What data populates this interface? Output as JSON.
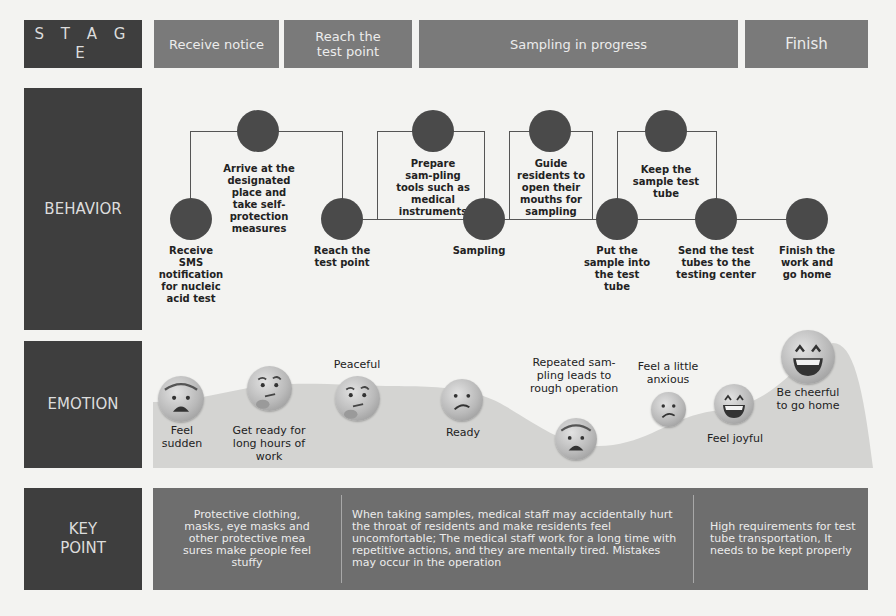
{
  "rows": {
    "stage": "S T A G E",
    "behavior": "BEHAVIOR",
    "emotion": "EMOTION",
    "key_point_line1": "KEY",
    "key_point_line2": "POINT"
  },
  "stages": [
    {
      "label": "Receive notice"
    },
    {
      "label": "Reach the test point"
    },
    {
      "label": "Sampling in progress"
    },
    {
      "label": "Finish"
    }
  ],
  "behaviors": {
    "bottom": [
      {
        "label": "Receive SMS notification for nucleic acid test"
      },
      {
        "label": "Reach the test point"
      },
      {
        "label": "Sampling"
      },
      {
        "label": "Put the sample into the test tube"
      },
      {
        "label": "Send the test tubes to the testing center"
      },
      {
        "label": "Finish the work and go home"
      }
    ],
    "top": [
      {
        "label": "Arrive at the designated place and take self-protection measures"
      },
      {
        "label": "Prepare sam-pling tools such as medical instruments"
      },
      {
        "label": "Guide residents to open their mouths for sampling"
      },
      {
        "label": "Keep the sample test tube"
      }
    ]
  },
  "emotions": [
    {
      "label": "Feel sudden",
      "face": "fearful-face-icon"
    },
    {
      "label": "Get ready for long hours of work",
      "face": "thinking-face-icon"
    },
    {
      "label": "Peaceful",
      "face": "thinking-face-icon"
    },
    {
      "label": "Ready",
      "face": "confused-face-icon"
    },
    {
      "label": "Repeated sam-pling leads to rough operation",
      "face": "fearful-face-icon"
    },
    {
      "label": "Feel a little anxious",
      "face": "confused-face-icon"
    },
    {
      "label": "Feel joyful",
      "face": "grinning-face-icon"
    },
    {
      "label": "Be cheerful to go home",
      "face": "grinning-face-icon"
    }
  ],
  "key_points": [
    {
      "text": "Protective clothing, masks, eye masks and other protective mea sures make people feel stuffy"
    },
    {
      "text": "When taking samples, medical staff may accidentally hurt the throat of residents and make residents feel uncomfortable; The medical staff work for a long time with repetitive actions, and they are mentally tired. Mistakes may occur in the operation"
    },
    {
      "text": "High requirements for test tube transportation, It needs to be kept properly"
    }
  ],
  "colors": {
    "label_box": "#3e3e3e",
    "stage_cell": "#7a7a7a",
    "key_panel": "#6e6e6e",
    "node": "#4a4a4a",
    "emotion_area": "#d4d4d2"
  }
}
